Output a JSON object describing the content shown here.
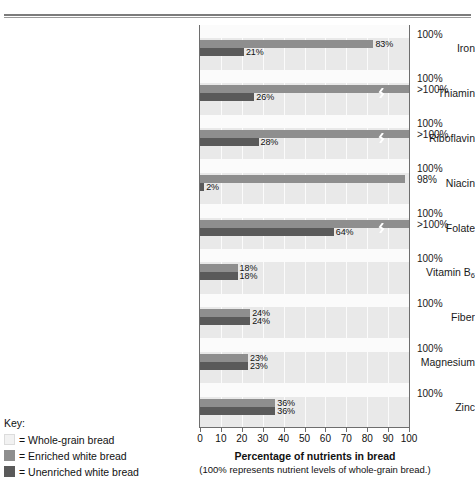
{
  "chart_data": {
    "type": "bar",
    "orientation": "horizontal",
    "title": "Percentage of nutrients in bread",
    "subtitle": "(100% represents nutrient levels of whole-grain bread.)",
    "xlabel": "Percentage of nutrients in bread",
    "ylabel": "",
    "xlim": [
      0,
      100
    ],
    "xticks": [
      "0",
      "10",
      "20",
      "30",
      "40",
      "50",
      "60",
      "70",
      "80",
      "90",
      "100"
    ],
    "grid": true,
    "legend_position": "bottom-left",
    "categories": [
      "Iron",
      "Thiamin",
      "Riboflavin",
      "Niacin",
      "Folate",
      "Vitamin B6",
      "Fiber",
      "Magnesium",
      "Zinc"
    ],
    "series": [
      {
        "name": "Enriched white bread",
        "color": "#8e8e8e",
        "values": [
          83,
          100,
          100,
          98,
          100,
          18,
          24,
          23,
          36
        ],
        "value_labels": [
          "83%",
          ">100%",
          ">100%",
          "98%",
          ">100%",
          "18%",
          "24%",
          "23%",
          "36%"
        ],
        "exceeds_axis": [
          false,
          true,
          true,
          false,
          true,
          false,
          false,
          false,
          false
        ]
      },
      {
        "name": "Unenriched white bread",
        "color": "#5a5a5a",
        "values": [
          21,
          26,
          28,
          2,
          64,
          18,
          24,
          23,
          36
        ],
        "value_labels": [
          "21%",
          "26%",
          "28%",
          "2%",
          "64%",
          "18%",
          "24%",
          "23%",
          "36%"
        ],
        "exceeds_axis": [
          false,
          false,
          false,
          false,
          false,
          false,
          false,
          false,
          false
        ]
      }
    ],
    "reference_series": {
      "name": "Whole-grain bread",
      "color": "#f2f2f2",
      "value": 100,
      "label": "100%"
    }
  },
  "rows": [
    {
      "label": "Iron",
      "enriched": 83,
      "enriched_label": "83%",
      "enriched_break": false,
      "unenriched": 21,
      "unenriched_label": "21%",
      "ref": "100%",
      "ref2": ""
    },
    {
      "label": "Thiamin",
      "enriched": 100,
      "enriched_label": "",
      "enriched_break": true,
      "unenriched": 26,
      "unenriched_label": "26%",
      "ref": "100%",
      "ref2": ">100%"
    },
    {
      "label": "Riboflavin",
      "enriched": 100,
      "enriched_label": "",
      "enriched_break": true,
      "unenriched": 28,
      "unenriched_label": "28%",
      "ref": "100%",
      "ref2": ">100%"
    },
    {
      "label": "Niacin",
      "enriched": 98,
      "enriched_label": "",
      "enriched_break": false,
      "unenriched": 2,
      "unenriched_label": "2%",
      "ref": "100%",
      "ref2": "98%"
    },
    {
      "label": "Folate",
      "enriched": 100,
      "enriched_label": "",
      "enriched_break": true,
      "unenriched": 64,
      "unenriched_label": "64%",
      "ref": "100%",
      "ref2": ">100%"
    },
    {
      "label": "Vitamin B6",
      "enriched": 18,
      "enriched_label": "18%",
      "enriched_break": false,
      "unenriched": 18,
      "unenriched_label": "18%",
      "ref": "100%",
      "ref2": ""
    },
    {
      "label": "Fiber",
      "enriched": 24,
      "enriched_label": "24%",
      "enriched_break": false,
      "unenriched": 24,
      "unenriched_label": "24%",
      "ref": "100%",
      "ref2": ""
    },
    {
      "label": "Magnesium",
      "enriched": 23,
      "enriched_label": "23%",
      "enriched_break": false,
      "unenriched": 23,
      "unenriched_label": "23%",
      "ref": "100%",
      "ref2": ""
    },
    {
      "label": "Zinc",
      "enriched": 36,
      "enriched_label": "36%",
      "enriched_break": false,
      "unenriched": 36,
      "unenriched_label": "36%",
      "ref": "100%",
      "ref2": ""
    }
  ],
  "axis": {
    "ticks": [
      "0",
      "10",
      "20",
      "30",
      "40",
      "50",
      "60",
      "70",
      "80",
      "90",
      "100"
    ],
    "title": "Percentage of nutrients in bread",
    "subtitle": "(100% represents nutrient levels of whole-grain bread.)"
  },
  "legend": {
    "title": "Key:",
    "items": [
      {
        "label": "= Whole-grain bread",
        "color": "#f2f2f2"
      },
      {
        "label": "= Enriched white bread",
        "color": "#8e8e8e"
      },
      {
        "label": "= Unenriched white bread",
        "color": "#5a5a5a"
      }
    ]
  }
}
